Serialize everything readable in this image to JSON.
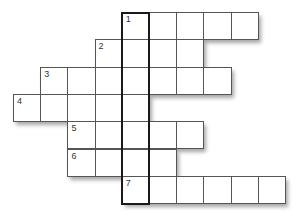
{
  "puzzle": {
    "type": "crossword",
    "cell_width": 27.2,
    "cell_height": 27.3,
    "origin_x": 13,
    "origin_y": 12,
    "key_column": 4,
    "key_column_label": "1",
    "colors": {
      "cell_border": "#555555",
      "key_border": "#1a1a1a",
      "cell_fill": "#ffffff",
      "number": "#333333"
    },
    "rows": [
      {
        "number": "1",
        "row": 0,
        "start_col": 4,
        "length": 5
      },
      {
        "number": "2",
        "row": 1,
        "start_col": 3,
        "length": 4
      },
      {
        "number": "3",
        "row": 2,
        "start_col": 1,
        "length": 7
      },
      {
        "number": "4",
        "row": 3,
        "start_col": 0,
        "length": 5
      },
      {
        "number": "5",
        "row": 4,
        "start_col": 2,
        "length": 5
      },
      {
        "number": "6",
        "row": 5,
        "start_col": 2,
        "length": 4
      },
      {
        "number": "7",
        "row": 6,
        "start_col": 4,
        "length": 6
      }
    ]
  }
}
